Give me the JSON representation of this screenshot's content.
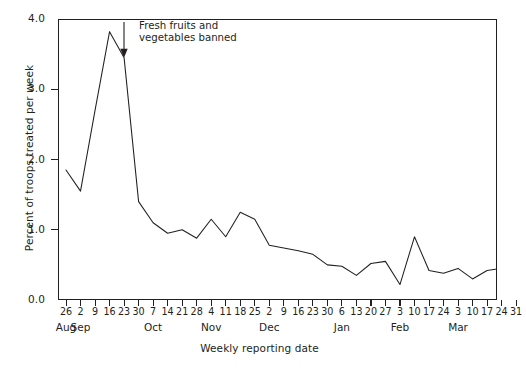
{
  "chart_data": {
    "type": "line",
    "title": "",
    "xlabel": "Weekly reporting date",
    "ylabel": "Percent of troops treated per week",
    "ylim": [
      0.0,
      4.0
    ],
    "yticks": [
      0.0,
      1.0,
      2.0,
      3.0,
      4.0
    ],
    "ytick_labels": [
      "0.0",
      "1.0",
      "2.0",
      "3.0",
      "4.0"
    ],
    "grid": false,
    "legend": "none",
    "line_color": "#231f20",
    "categories": [
      "26",
      "2",
      "9",
      "16",
      "23",
      "30",
      "7",
      "14",
      "21",
      "28",
      "4",
      "11",
      "18",
      "25",
      "2",
      "9",
      "16",
      "23",
      "30",
      "6",
      "13",
      "20",
      "27",
      "3",
      "10",
      "17",
      "24",
      "3",
      "10",
      "17",
      "24",
      "31"
    ],
    "month_labels": [
      "Aug",
      "Sep",
      "Oct",
      "Nov",
      "Dec",
      "Jan",
      "Feb",
      "Mar"
    ],
    "month_tick_index": [
      0,
      1,
      6,
      10,
      14,
      19,
      23,
      27
    ],
    "values": [
      1.85,
      1.55,
      2.7,
      3.82,
      3.45,
      1.4,
      1.1,
      0.95,
      1.0,
      0.88,
      1.15,
      0.9,
      1.25,
      1.15,
      0.78,
      0.74,
      0.7,
      0.65,
      0.5,
      0.48,
      0.35,
      0.52,
      0.55,
      0.22,
      0.9,
      0.42,
      0.38,
      0.45,
      0.3,
      0.42,
      0.45,
      0.15
    ],
    "annotations": [
      {
        "text": "Fresh fruits and\nvegetables banned",
        "arrow": "down-arrow",
        "points_to_category": "23",
        "points_to_value": 3.45
      }
    ]
  }
}
